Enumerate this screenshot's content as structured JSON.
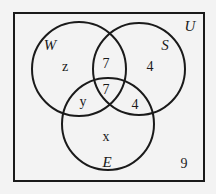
{
  "diagram": {
    "type": "venn",
    "universe_label": "U",
    "sets": [
      {
        "name": "W",
        "label": "W"
      },
      {
        "name": "S",
        "label": "S"
      },
      {
        "name": "E",
        "label": "E"
      }
    ],
    "regions": {
      "W_only": "z",
      "W_and_S_only": "7",
      "S_only": "4",
      "W_and_S_and_E": "7",
      "W_and_E_only": "y",
      "S_and_E_only": "4",
      "E_only": "x",
      "outside": "9"
    },
    "colors": {
      "stroke": "#1a1a1a",
      "background": "#f3f3f3"
    }
  }
}
